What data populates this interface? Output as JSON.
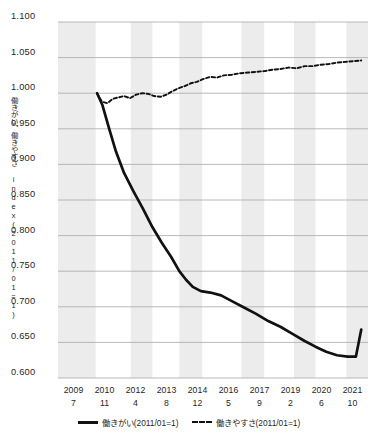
{
  "chart_data": {
    "type": "line",
    "title": "",
    "xlabel": "",
    "ylabel": "働きがい、働きやすさ index(2011/01=1)",
    "ylim": [
      0.6,
      1.1
    ],
    "ytick_labels": [
      "1.100",
      "1.050",
      "1.000",
      "0.950",
      "0.900",
      "0.850",
      "0.800",
      "0.750",
      "0.700",
      "0.650",
      "0.600"
    ],
    "ytick_values": [
      1.1,
      1.05,
      1.0,
      0.95,
      0.9,
      0.85,
      0.8,
      0.75,
      0.7,
      0.65,
      0.6
    ],
    "grid": true,
    "legend_position": "bottom",
    "xtick_years": [
      "2009",
      "2010",
      "2012",
      "2013",
      "2014",
      "2016",
      "2017",
      "2019",
      "2020",
      "2021"
    ],
    "xtick_months": [
      "7",
      "11",
      "4",
      "8",
      "12",
      "5",
      "9",
      "2",
      "6",
      "10"
    ],
    "x_axis_note": "年/月",
    "series": [
      {
        "name": "働きがい(2011/01=1)",
        "style": "solid",
        "color": "#111111",
        "x": [
          2011.0,
          2011.2,
          2011.45,
          2011.7,
          2012.0,
          2012.35,
          2012.7,
          2013.05,
          2013.4,
          2013.75,
          2014.05,
          2014.3,
          2014.55,
          2014.85,
          2015.2,
          2015.6,
          2016.0,
          2016.45,
          2016.9,
          2017.35,
          2017.8,
          2018.25,
          2018.7,
          2019.1,
          2019.5,
          2019.9,
          2020.3,
          2020.6,
          2020.8
        ],
        "values": [
          1.0,
          0.983,
          0.95,
          0.918,
          0.888,
          0.862,
          0.838,
          0.812,
          0.79,
          0.77,
          0.75,
          0.738,
          0.728,
          0.722,
          0.72,
          0.716,
          0.708,
          0.699,
          0.69,
          0.68,
          0.672,
          0.662,
          0.652,
          0.644,
          0.637,
          0.632,
          0.63,
          0.63,
          0.668
        ]
      },
      {
        "name": "働きやすさ(2011/01=1)",
        "style": "dashed",
        "color": "#111111",
        "x": [
          2011.0,
          2011.18,
          2011.38,
          2011.58,
          2011.78,
          2012.0,
          2012.22,
          2012.45,
          2012.68,
          2012.9,
          2013.12,
          2013.35,
          2013.58,
          2013.8,
          2014.02,
          2014.25,
          2014.48,
          2014.7,
          2014.95,
          2015.2,
          2015.45,
          2015.7,
          2016.0,
          2016.3,
          2016.6,
          2016.9,
          2017.2,
          2017.5,
          2017.8,
          2018.1,
          2018.4,
          2018.7,
          2019.0,
          2019.3,
          2019.6,
          2019.9,
          2020.2,
          2020.5,
          2020.8
        ],
        "values": [
          1.0,
          0.988,
          0.986,
          0.992,
          0.994,
          0.996,
          0.993,
          0.998,
          1.0,
          0.999,
          0.996,
          0.995,
          0.998,
          1.003,
          1.007,
          1.01,
          1.014,
          1.016,
          1.02,
          1.023,
          1.022,
          1.025,
          1.026,
          1.028,
          1.029,
          1.03,
          1.031,
          1.033,
          1.034,
          1.036,
          1.035,
          1.038,
          1.038,
          1.04,
          1.041,
          1.043,
          1.044,
          1.045,
          1.046
        ]
      }
    ],
    "shaded_bands": [
      [
        2009.55,
        2010.95
      ],
      [
        2012.25,
        2013.05
      ],
      [
        2014.05,
        2014.9
      ],
      [
        2016.35,
        2017.2
      ],
      [
        2018.3,
        2019.1
      ],
      [
        2020.25,
        2021.05
      ]
    ]
  },
  "legend": {
    "items": [
      {
        "label": "働きがい(2011/01=1)",
        "style": "solid"
      },
      {
        "label": "働きやすさ(2011/01=1)",
        "style": "dashed"
      }
    ]
  }
}
